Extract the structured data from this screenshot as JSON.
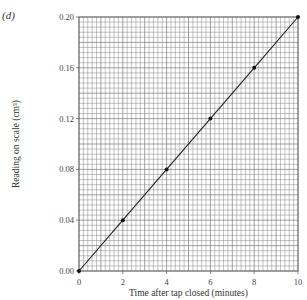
{
  "part_label": "(d)",
  "chart_data": {
    "type": "line",
    "title": "",
    "xlabel": "Time after tap closed (minutes)",
    "ylabel": "Reading on scale (cm³)",
    "x": [
      0,
      2,
      4,
      6,
      8,
      10
    ],
    "series": [
      {
        "name": "Reading",
        "values": [
          0.0,
          0.04,
          0.08,
          0.12,
          0.16,
          0.2
        ],
        "markers": true
      }
    ],
    "xlim": [
      0,
      10
    ],
    "ylim": [
      0.0,
      0.2
    ],
    "xticks": [
      "0",
      "2",
      "4",
      "6",
      "8",
      "10"
    ],
    "yticks": [
      "0.00",
      "0.04",
      "0.08",
      "0.12",
      "0.16",
      "0.20"
    ],
    "grid": {
      "on": true,
      "minor_per_major": 10
    },
    "legend": null
  },
  "colors": {
    "grid": "#7a7a7a",
    "line": "#222222",
    "marker": "#111111"
  }
}
